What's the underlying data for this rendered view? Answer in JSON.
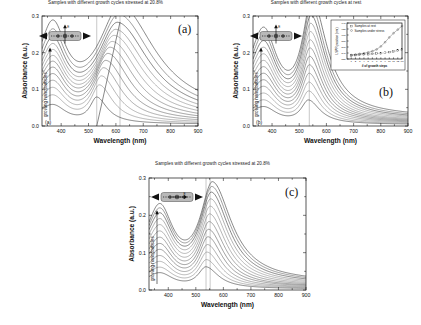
{
  "figure": {
    "panels": [
      {
        "key": "a",
        "letter": "(a)",
        "corner_label": "(a)",
        "title": "Samples with different growth cycles stressed at 20.8%",
        "xlabel": "Wavelength (nm)",
        "ylabel": "Absorbance (a.u.)",
        "growth_label": "growing nanoparticles",
        "schematic": "nanorod-with-vertical-E-field",
        "field_label": "E"
      },
      {
        "key": "b",
        "letter": "(b)",
        "corner_label": "(b)",
        "title": "Samples with different growth cycles at rest",
        "xlabel": "Wavelength (nm)",
        "ylabel": "Absorbance (a.u.)",
        "growth_label": "growing nanoparticles",
        "schematic": "nanorod-with-vertical-E-field",
        "field_label": "E"
      },
      {
        "key": "c",
        "letter": "(c)",
        "corner_label": "",
        "title": "Samples with different growth cycles stressed at 20.8%",
        "xlabel": "Wavelength (nm)",
        "ylabel": "Absorbance (a.u.)",
        "growth_label": "growing nanoparticles",
        "schematic": "nanorod-with-horizontal-E-field",
        "field_label": "E"
      }
    ]
  },
  "chart_data": [
    {
      "id": "panel-a",
      "type": "line",
      "title": "Samples with different growth cycles stressed at 20.8%",
      "xlabel": "Wavelength (nm)",
      "ylabel": "Absorbance (a.u.)",
      "xlim": [
        330,
        900
      ],
      "ylim": [
        0.0,
        0.3
      ],
      "xticks": [
        400,
        500,
        600,
        700,
        800,
        900
      ],
      "yticks": [
        0.0,
        0.1,
        0.2,
        0.3
      ],
      "grid": false,
      "legend": "none",
      "annotations": [
        {
          "text": "growing nanoparticles",
          "orientation": "vertical",
          "meaning": "arrow indicating increasing growth cycles"
        },
        {
          "text": "(a)",
          "position": "bottom-left-inside"
        },
        {
          "text": "(a)",
          "position": "top-right-outside"
        }
      ],
      "marker_lines_nm": [
        530,
        615
      ],
      "trend_line": {
        "from_nm": 530,
        "to_nm": 615,
        "description": "diagonal line tracking redshift of LSPR peak with growth"
      },
      "series_description": "13 absorbance spectra of growing gold nanoparticles under 20.8% strain; LSPR peak redshifts from ~530 nm to ~615 nm and broadens as particles grow",
      "n_series": 13,
      "series": [
        {
          "name": "cycle 1",
          "peak_nm": 530,
          "peak_absorbance": 0.068,
          "baseline_900nm": 0.01
        },
        {
          "name": "cycle 2",
          "peak_nm": 540,
          "peak_absorbance": 0.098,
          "baseline_900nm": 0.013
        },
        {
          "name": "cycle 3",
          "peak_nm": 548,
          "peak_absorbance": 0.12,
          "baseline_900nm": 0.016
        },
        {
          "name": "cycle 4",
          "peak_nm": 556,
          "peak_absorbance": 0.14,
          "baseline_900nm": 0.019
        },
        {
          "name": "cycle 5",
          "peak_nm": 564,
          "peak_absorbance": 0.158,
          "baseline_900nm": 0.022
        },
        {
          "name": "cycle 6",
          "peak_nm": 572,
          "peak_absorbance": 0.175,
          "baseline_900nm": 0.025
        },
        {
          "name": "cycle 7",
          "peak_nm": 580,
          "peak_absorbance": 0.19,
          "baseline_900nm": 0.028
        },
        {
          "name": "cycle 8",
          "peak_nm": 588,
          "peak_absorbance": 0.204,
          "baseline_900nm": 0.031
        },
        {
          "name": "cycle 9",
          "peak_nm": 595,
          "peak_absorbance": 0.218,
          "baseline_900nm": 0.035
        },
        {
          "name": "cycle 10",
          "peak_nm": 601,
          "peak_absorbance": 0.232,
          "baseline_900nm": 0.039
        },
        {
          "name": "cycle 11",
          "peak_nm": 607,
          "peak_absorbance": 0.248,
          "baseline_900nm": 0.044
        },
        {
          "name": "cycle 12",
          "peak_nm": 612,
          "peak_absorbance": 0.266,
          "baseline_900nm": 0.05
        },
        {
          "name": "cycle 13",
          "peak_nm": 618,
          "peak_absorbance": 0.286,
          "baseline_900nm": 0.057
        }
      ]
    },
    {
      "id": "panel-b",
      "type": "line",
      "title": "Samples with different growth cycles at rest",
      "xlabel": "Wavelength (nm)",
      "ylabel": "Absorbance (a.u.)",
      "xlim": [
        330,
        900
      ],
      "ylim": [
        0.0,
        0.3
      ],
      "xticks": [
        400,
        500,
        600,
        700,
        800,
        900
      ],
      "yticks": [
        0.0,
        0.1,
        0.2,
        0.3
      ],
      "grid": false,
      "legend": "none",
      "annotations": [
        {
          "text": "growing nanoparticles",
          "orientation": "vertical",
          "meaning": "arrow indicating increasing growth cycles"
        },
        {
          "text": "(b)",
          "position": "bottom-left-inside"
        },
        {
          "text": "(b)",
          "position": "right-inside"
        }
      ],
      "marker_lines_nm": [
        537
      ],
      "series_description": "13 absorbance spectra of growing gold nanoparticles at rest; LSPR peak stays near 537-550 nm and grows in intensity",
      "n_series": 13,
      "series": [
        {
          "name": "cycle 1",
          "peak_nm": 534,
          "peak_absorbance": 0.062,
          "baseline_900nm": 0.008
        },
        {
          "name": "cycle 2",
          "peak_nm": 535,
          "peak_absorbance": 0.084,
          "baseline_900nm": 0.01
        },
        {
          "name": "cycle 3",
          "peak_nm": 536,
          "peak_absorbance": 0.105,
          "baseline_900nm": 0.013
        },
        {
          "name": "cycle 4",
          "peak_nm": 537,
          "peak_absorbance": 0.126,
          "baseline_900nm": 0.016
        },
        {
          "name": "cycle 5",
          "peak_nm": 538,
          "peak_absorbance": 0.146,
          "baseline_900nm": 0.019
        },
        {
          "name": "cycle 6",
          "peak_nm": 539,
          "peak_absorbance": 0.166,
          "baseline_900nm": 0.022
        },
        {
          "name": "cycle 7",
          "peak_nm": 540,
          "peak_absorbance": 0.186,
          "baseline_900nm": 0.025
        },
        {
          "name": "cycle 8",
          "peak_nm": 541,
          "peak_absorbance": 0.205,
          "baseline_900nm": 0.028
        },
        {
          "name": "cycle 9",
          "peak_nm": 542,
          "peak_absorbance": 0.224,
          "baseline_900nm": 0.032
        },
        {
          "name": "cycle 10",
          "peak_nm": 543,
          "peak_absorbance": 0.243,
          "baseline_900nm": 0.036
        },
        {
          "name": "cycle 11",
          "peak_nm": 544,
          "peak_absorbance": 0.262,
          "baseline_900nm": 0.04
        },
        {
          "name": "cycle 12",
          "peak_nm": 545,
          "peak_absorbance": 0.28,
          "baseline_900nm": 0.045
        },
        {
          "name": "cycle 13",
          "peak_nm": 547,
          "peak_absorbance": 0.298,
          "baseline_900nm": 0.05
        }
      ],
      "inset": {
        "id": "panel-b-inset",
        "type": "scatter",
        "xlabel": "# of growth steps",
        "ylabel": "LSPR position (nm)",
        "xlim": [
          0,
          13
        ],
        "ylim": [
          520,
          640
        ],
        "xticks": [
          1,
          2,
          3,
          4,
          5,
          6,
          7,
          8,
          9,
          10,
          11,
          12,
          13
        ],
        "yticks": [
          520,
          540,
          560,
          580,
          600,
          620,
          640
        ],
        "grid": false,
        "legend_position": "top-left",
        "series": [
          {
            "name": "Samples at rest",
            "marker": "square-open",
            "x": [
              1,
              2,
              3,
              4,
              5,
              6,
              7,
              8,
              9,
              10,
              11,
              12,
              13
            ],
            "values": [
              532,
              533,
              534,
              535,
              536,
              537,
              538,
              539,
              541,
              543,
              545,
              548,
              552
            ]
          },
          {
            "name": "Samples under stress",
            "marker": "circle-open",
            "x": [
              1,
              2,
              3,
              4,
              5,
              6,
              7,
              8,
              9,
              10,
              11,
              12,
              13
            ],
            "values": [
              533,
              535,
              537,
              539,
              542,
              546,
              552,
              562,
              576,
              592,
              606,
              618,
              630
            ]
          }
        ]
      }
    },
    {
      "id": "panel-c",
      "type": "line",
      "title": "Samples with different growth cycles stressed at 20.8%",
      "xlabel": "Wavelength (nm)",
      "ylabel": "Absorbance (a.u.)",
      "xlim": [
        330,
        900
      ],
      "ylim": [
        0.0,
        0.3
      ],
      "xticks": [
        400,
        500,
        600,
        700,
        800,
        900
      ],
      "yticks": [
        0.0,
        0.1,
        0.2,
        0.3
      ],
      "grid": false,
      "legend": "none",
      "annotations": [
        {
          "text": "growing nanoparticles",
          "orientation": "vertical",
          "meaning": "arrow indicating increasing growth cycles"
        }
      ],
      "marker_lines_nm": [
        537,
        552
      ],
      "series_description": "13 absorbance spectra of growing gold nanoparticles stressed at 20.8% with E field parallel to strain; LSPR peak near 540-560 nm increases in intensity",
      "n_series": 13,
      "series": [
        {
          "name": "cycle 1",
          "peak_nm": 537,
          "peak_absorbance": 0.055,
          "baseline_900nm": 0.006
        },
        {
          "name": "cycle 2",
          "peak_nm": 539,
          "peak_absorbance": 0.072,
          "baseline_900nm": 0.008
        },
        {
          "name": "cycle 3",
          "peak_nm": 541,
          "peak_absorbance": 0.09,
          "baseline_900nm": 0.01
        },
        {
          "name": "cycle 4",
          "peak_nm": 543,
          "peak_absorbance": 0.108,
          "baseline_900nm": 0.012
        },
        {
          "name": "cycle 5",
          "peak_nm": 545,
          "peak_absorbance": 0.126,
          "baseline_900nm": 0.015
        },
        {
          "name": "cycle 6",
          "peak_nm": 547,
          "peak_absorbance": 0.144,
          "baseline_900nm": 0.017
        },
        {
          "name": "cycle 7",
          "peak_nm": 549,
          "peak_absorbance": 0.162,
          "baseline_900nm": 0.02
        },
        {
          "name": "cycle 8",
          "peak_nm": 551,
          "peak_absorbance": 0.18,
          "baseline_900nm": 0.023
        },
        {
          "name": "cycle 9",
          "peak_nm": 553,
          "peak_absorbance": 0.198,
          "baseline_900nm": 0.026
        },
        {
          "name": "cycle 10",
          "peak_nm": 555,
          "peak_absorbance": 0.215,
          "baseline_900nm": 0.029
        },
        {
          "name": "cycle 11",
          "peak_nm": 557,
          "peak_absorbance": 0.23,
          "baseline_900nm": 0.033
        },
        {
          "name": "cycle 12",
          "peak_nm": 559,
          "peak_absorbance": 0.242,
          "baseline_900nm": 0.037
        },
        {
          "name": "cycle 13",
          "peak_nm": 561,
          "peak_absorbance": 0.252,
          "baseline_900nm": 0.041
        }
      ]
    }
  ]
}
